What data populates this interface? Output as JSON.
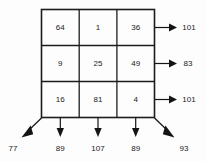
{
  "figure": {
    "type": "magic-square-sum-diagram",
    "grid": {
      "rows": [
        [
          "64",
          "1",
          "36"
        ],
        [
          "9",
          "25",
          "49"
        ],
        [
          "16",
          "81",
          "4"
        ]
      ]
    },
    "row_sums": [
      "101",
      "83",
      "101"
    ],
    "column_sums": [
      "89",
      "107",
      "89"
    ],
    "diagonal_sums": {
      "anti_diagonal": "77",
      "main_diagonal": "93"
    },
    "colors": {
      "line": "#1d1d1d",
      "text": "#1a1a1a",
      "background": "#fdfdfd"
    }
  }
}
